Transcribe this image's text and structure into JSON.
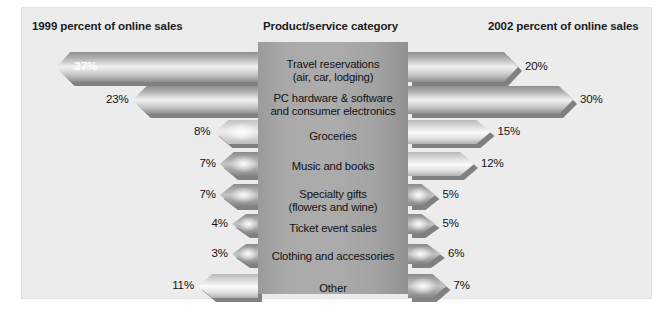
{
  "figure": {
    "headers": {
      "left": "1999 percent of online sales",
      "middle": "Product/service category",
      "right": "2002 percent of online sales"
    }
  },
  "chart_data": {
    "type": "bar",
    "title": "",
    "orientation": "horizontal-bidirectional",
    "xlabel": "",
    "ylabel": "",
    "grid": false,
    "legend": "none",
    "categories": [
      "Travel reservations\n(air, car, lodging)",
      "PC hardware & software\nand consumer electronics",
      "Groceries",
      "Music and books",
      "Specialty gifts\n(flowers and wine)",
      "Ticket event sales",
      "Clothing and accessories",
      "Other"
    ],
    "series": [
      {
        "name": "1999 percent of online sales",
        "side": "left",
        "values": [
          37,
          23,
          8,
          7,
          7,
          4,
          3,
          11
        ]
      },
      {
        "name": "2002 percent of online sales",
        "side": "right",
        "values": [
          20,
          30,
          15,
          12,
          5,
          5,
          6,
          7
        ]
      }
    ],
    "value_suffix": "%"
  },
  "rows": [
    {
      "label_line1": "Travel reservations",
      "label_line2": "(air, car, lodging)",
      "left_value": "37%",
      "right_value": "20%"
    },
    {
      "label_line1": "PC hardware & software",
      "label_line2": "and consumer electronics",
      "left_value": "23%",
      "right_value": "30%"
    },
    {
      "label_line1": "Groceries",
      "label_line2": "",
      "left_value": "8%",
      "right_value": "15%"
    },
    {
      "label_line1": "Music and books",
      "label_line2": "",
      "left_value": "7%",
      "right_value": "12%"
    },
    {
      "label_line1": "Specialty gifts",
      "label_line2": "(flowers and wine)",
      "left_value": "7%",
      "right_value": "5%"
    },
    {
      "label_line1": "Ticket event sales",
      "label_line2": "",
      "left_value": "4%",
      "right_value": "5%"
    },
    {
      "label_line1": "Clothing and accessories",
      "label_line2": "",
      "left_value": "3%",
      "right_value": "6%"
    },
    {
      "label_line1": "Other",
      "label_line2": "",
      "left_value": "11%",
      "right_value": "7%"
    }
  ],
  "colors": {
    "panel_background": "#ececed",
    "center_column": "#a9a9aa",
    "bar_dark": "#8d8d8e",
    "bar_light": "#f2f2f2",
    "text": "#111111",
    "inside_label_text": "#ffffff"
  }
}
